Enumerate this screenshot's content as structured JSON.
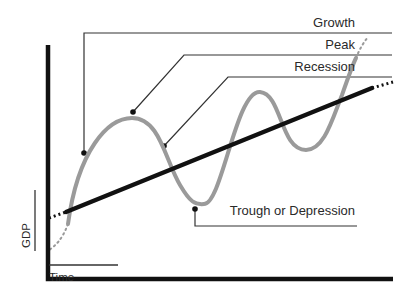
{
  "axes": {
    "y_label": "GDP",
    "x_label": "Time"
  },
  "labels": {
    "growth": "Growth",
    "peak": "Peak",
    "recession": "Recession",
    "trough": "Trough or Depression"
  },
  "colors": {
    "cycle_curve": "#9a9a9a",
    "trend_line": "#111111",
    "axis": "#111111",
    "callout": "#333333",
    "text": "#2a2a2a"
  },
  "geometry": {
    "axis": {
      "x0": 48,
      "y0": 279,
      "x_end": 393,
      "y_top": 45
    },
    "trend": {
      "x1": 66,
      "y1": 212,
      "x2": 372,
      "y2": 88,
      "dot_start": [
        49,
        218
      ],
      "dot_end": [
        393,
        82
      ]
    },
    "cycle_path": "M 68 224 C 78 150, 108 118, 132 118 C 160 118, 165 160, 180 185 C 190 202, 195 205, 204 204 C 222 204, 236 90, 260 92 C 282 94, 280 150, 306 150 C 324 150, 332 120, 342 95 C 350 72, 353 64, 356 58",
    "cycle_dot_start": "M 68 224 C 62 240, 55 246, 49 250",
    "cycle_dot_end": "M 356 58 C 360 48, 364 42, 368 37",
    "callouts": {
      "growth": {
        "points": "84,153 84,33 392,33",
        "dot": [
          84,
          153
        ]
      },
      "peak": {
        "points": "133,112 184,55 392,55",
        "dot": [
          133,
          112
        ]
      },
      "recession": {
        "points": "164,146 228,77 392,77",
        "dot": [
          164,
          146
        ]
      },
      "trough": {
        "points": "195,209 195,226 357,226",
        "dot": [
          195,
          209
        ]
      }
    },
    "y_label_bar": {
      "x": 35,
      "y1": 190,
      "y2": 251
    },
    "x_label_bar": {
      "x1": 49,
      "x2": 118,
      "y": 265
    }
  }
}
